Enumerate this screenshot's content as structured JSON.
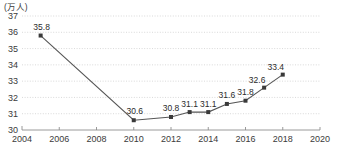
{
  "chart_data": {
    "type": "line",
    "title": "",
    "subtitle": "",
    "xlabel": "",
    "ylabel": "",
    "unit_label": "(万人)",
    "xlim": [
      2004,
      2020
    ],
    "ylim": [
      30,
      37
    ],
    "grid": true,
    "legend": false,
    "y_ticks": [
      "30",
      "31",
      "32",
      "33",
      "34",
      "35",
      "36",
      "37"
    ],
    "y_tick_values": [
      30,
      31,
      32,
      33,
      34,
      35,
      36,
      37
    ],
    "x_ticks": [
      "2004",
      "2006",
      "2008",
      "2010",
      "2012",
      "2014",
      "2016",
      "2018",
      "2020"
    ],
    "x_tick_values": [
      2004,
      2006,
      2008,
      2010,
      2012,
      2014,
      2016,
      2018,
      2020
    ],
    "series": [
      {
        "name": "",
        "color": "#555555",
        "marker": "square",
        "x": [
          2005,
          2010,
          2012,
          2013,
          2014,
          2015,
          2016,
          2017,
          2018
        ],
        "values": [
          35.8,
          30.6,
          30.8,
          31.1,
          31.1,
          31.6,
          31.8,
          32.6,
          33.4
        ],
        "point_labels": [
          "35.8",
          "30.6",
          "30.8",
          "31.1",
          "31.1",
          "31.6",
          "31.8",
          "32.6",
          "33.4"
        ]
      }
    ]
  },
  "colors": {
    "line": "#555555",
    "marker": "#3a3a3a",
    "grid": "#c9c9c9",
    "axis": "#8f8f8f",
    "text": "#3b3b3b",
    "background": "#ffffff"
  }
}
